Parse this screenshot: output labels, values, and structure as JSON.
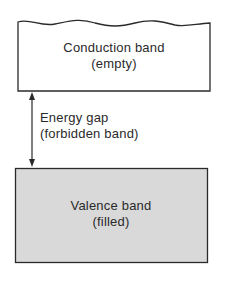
{
  "diagram": {
    "type": "energy-band-diagram",
    "conduction_band": {
      "title": "Conduction band",
      "state": "(empty)",
      "fill": "#ffffff"
    },
    "energy_gap": {
      "title": "Energy gap",
      "subtitle": "(forbidden band)"
    },
    "valence_band": {
      "title": "Valence band",
      "state": "(filled)",
      "fill": "#d9d9d9"
    },
    "colors": {
      "stroke": "#2a2a2a",
      "background": "#ffffff"
    }
  }
}
